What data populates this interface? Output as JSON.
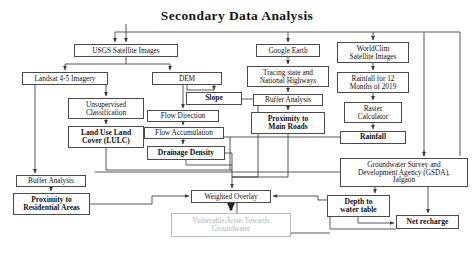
{
  "diagram": {
    "title": "Secondary Data Analysis",
    "type": "flowchart",
    "nodes": [
      {
        "id": "usgs",
        "label": "USGS Satellite Images",
        "bold": false,
        "muted": false,
        "x": 74,
        "y": 44,
        "w": 104,
        "h": 13
      },
      {
        "id": "landsat",
        "label": "Landsat 4-5 Imagery",
        "bold": false,
        "muted": false,
        "x": 22,
        "y": 72,
        "w": 86,
        "h": 13
      },
      {
        "id": "dem",
        "label": "DEM",
        "bold": false,
        "muted": false,
        "x": 152,
        "y": 72,
        "w": 70,
        "h": 13
      },
      {
        "id": "unsup",
        "label": "Unsupervised\nClassification",
        "bold": false,
        "muted": false,
        "x": 68,
        "y": 98,
        "w": 76,
        "h": 21
      },
      {
        "id": "slope",
        "label": "Slope",
        "bold": true,
        "muted": false,
        "x": 186,
        "y": 92,
        "w": 56,
        "h": 13
      },
      {
        "id": "flowdir",
        "label": "Flow Direction",
        "bold": false,
        "muted": false,
        "x": 147,
        "y": 110,
        "w": 72,
        "h": 12
      },
      {
        "id": "lulc",
        "label": "Land Use Land\nCover (LULC)",
        "bold": true,
        "muted": false,
        "x": 68,
        "y": 126,
        "w": 76,
        "h": 22
      },
      {
        "id": "flowacc",
        "label": "Flow Accumulation",
        "bold": false,
        "muted": false,
        "x": 144,
        "y": 127,
        "w": 80,
        "h": 12
      },
      {
        "id": "drainage",
        "label": "Drainage Density",
        "bold": true,
        "muted": false,
        "x": 147,
        "y": 146,
        "w": 78,
        "h": 14
      },
      {
        "id": "gearth",
        "label": "Google Earth",
        "bold": false,
        "muted": false,
        "x": 256,
        "y": 44,
        "w": 64,
        "h": 13
      },
      {
        "id": "tracing",
        "label": "Tracing state and\nNational Highways",
        "bold": false,
        "muted": false,
        "x": 247,
        "y": 66,
        "w": 82,
        "h": 21
      },
      {
        "id": "bufferroads",
        "label": "Buffer Analysis",
        "bold": false,
        "muted": false,
        "x": 253,
        "y": 94,
        "w": 70,
        "h": 12
      },
      {
        "id": "proxroads",
        "label": "Proximity to\nMain Roads",
        "bold": true,
        "muted": false,
        "x": 251,
        "y": 112,
        "w": 74,
        "h": 22
      },
      {
        "id": "worldclim",
        "label": "WorldClim\nSatellite Images",
        "bold": false,
        "muted": false,
        "x": 337,
        "y": 42,
        "w": 72,
        "h": 21
      },
      {
        "id": "rain12",
        "label": "Rainfall for 12\nMonths of 2019",
        "bold": false,
        "muted": false,
        "x": 337,
        "y": 72,
        "w": 72,
        "h": 21
      },
      {
        "id": "raster",
        "label": "Raster\nCalculator",
        "bold": false,
        "muted": false,
        "x": 344,
        "y": 102,
        "w": 58,
        "h": 21
      },
      {
        "id": "rainfall",
        "label": "Rainfall",
        "bold": true,
        "muted": false,
        "x": 340,
        "y": 131,
        "w": 66,
        "h": 13
      },
      {
        "id": "gsda",
        "label": "Groundwater Survey and\nDevelopment Agency (GSDA),\nJalgaon",
        "bold": false,
        "muted": false,
        "x": 340,
        "y": 158,
        "w": 128,
        "h": 29
      },
      {
        "id": "bufferres",
        "label": "Buffer Analysis",
        "bold": false,
        "muted": false,
        "x": 16,
        "y": 175,
        "w": 70,
        "h": 12
      },
      {
        "id": "proxres",
        "label": "Proximity to\nResidential Areas",
        "bold": true,
        "muted": false,
        "x": 13,
        "y": 193,
        "w": 77,
        "h": 22
      },
      {
        "id": "weighted",
        "label": "Weighted Overlay",
        "bold": false,
        "muted": false,
        "x": 191,
        "y": 190,
        "w": 80,
        "h": 13
      },
      {
        "id": "vulnerable",
        "label": "Vulnerable Areas Towards\nGroundwater",
        "bold": false,
        "muted": true,
        "x": 171,
        "y": 213,
        "w": 120,
        "h": 24
      },
      {
        "id": "depth",
        "label": "Depth to\nwater table",
        "bold": true,
        "muted": false,
        "x": 327,
        "y": 195,
        "w": 63,
        "h": 22
      },
      {
        "id": "netrecharge",
        "label": "Net recharge",
        "bold": true,
        "muted": false,
        "x": 396,
        "y": 215,
        "w": 63,
        "h": 14
      }
    ],
    "colors": {
      "line": "#3a3a3a",
      "muted_line": "#b9b9b9",
      "text": "#111111",
      "muted_text": "#b4b4b4",
      "background": "#ffffff"
    }
  }
}
